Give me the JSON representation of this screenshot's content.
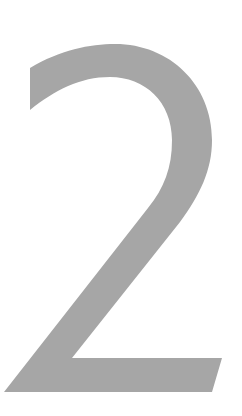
{
  "glyph": {
    "character": "2",
    "fill_color": "#a6a6a6",
    "background_color": "#ffffff"
  }
}
